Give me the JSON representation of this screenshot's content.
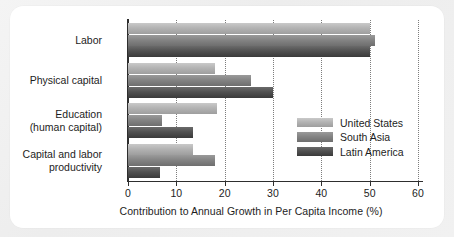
{
  "chart_data": {
    "type": "bar",
    "orientation": "horizontal",
    "title": "",
    "xlabel": "Contribution to Annual Growth in Per Capita Income (%)",
    "ylabel": "",
    "xlim": [
      0,
      60
    ],
    "xticks": [
      0,
      10,
      20,
      30,
      40,
      50,
      60
    ],
    "xticklabels": [
      "0",
      "10",
      "20",
      "30",
      "40",
      "50",
      "60"
    ],
    "grid": "vertical-dotted",
    "legend_position": "center-right",
    "categories": [
      "Labor",
      "Physical capital",
      "Education\n(human capital)",
      "Capital and labor\nproductivity"
    ],
    "category_lines": [
      [
        "Labor"
      ],
      [
        "Physical capital"
      ],
      [
        "Education",
        "(human capital)"
      ],
      [
        "Capital and labor",
        "productivity"
      ]
    ],
    "series": [
      {
        "name": "United States",
        "color": "#b3b3b3",
        "values": [
          50,
          18,
          18.5,
          13.5
        ]
      },
      {
        "name": "South Asia",
        "color": "#848484",
        "values": [
          51,
          25.5,
          7,
          18
        ]
      },
      {
        "name": "Latin America",
        "color": "#515151",
        "values": [
          50,
          30,
          13.5,
          6.7
        ]
      }
    ]
  },
  "legend": {
    "entries": [
      {
        "label": "United States"
      },
      {
        "label": "South Asia"
      },
      {
        "label": "Latin America"
      }
    ]
  },
  "colors": {
    "card_background": "#ffffff",
    "page_background": "#f1f1f1",
    "axis": "#2e2e2e",
    "gridline": "#7d7d7d",
    "text": "#1d1d1d",
    "series_united_states": "#b3b3b3",
    "series_south_asia": "#848484",
    "series_latin_america": "#515151"
  }
}
